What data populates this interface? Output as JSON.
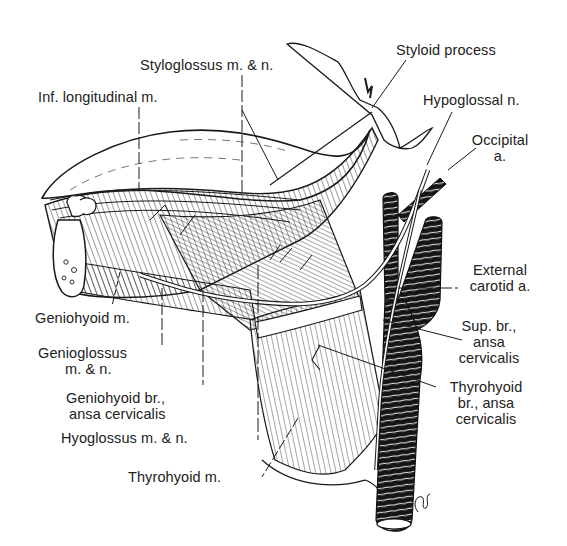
{
  "figure": {
    "colors": {
      "ink": "#1a1a1a",
      "background": "#ffffff",
      "label_text": "#222222"
    },
    "artist_signature": "jcb"
  },
  "labels": {
    "styloid_process": "Styloid process",
    "styloglossus": "Styloglossus m. & n.",
    "inf_longitudinal": "Inf. longitudinal m.",
    "hypoglossal_n": "Hypoglossal n.",
    "occipital_a_line1": "Occipital",
    "occipital_a_line2": "a.",
    "external_carotid_line1": "External",
    "external_carotid_line2": "carotid a.",
    "geniohyoid_m": "Geniohyoid m.",
    "sup_br_line1": "Sup. br.,",
    "sup_br_line2": "ansa",
    "sup_br_line3": "cervicalis",
    "genioglossus_line1": "Genioglossus",
    "genioglossus_line2": "m. & n.",
    "thyrohyoid_br_line1": "Thyrohyoid",
    "thyrohyoid_br_line2": "br., ansa",
    "thyrohyoid_br_line3": "cervicalis",
    "geniohyoid_br_line1": "Geniohyoid br.,",
    "geniohyoid_br_line2": "ansa cervicalis",
    "hyoglossus": "Hyoglossus m. & n.",
    "thyrohyoid_m": "Thyrohyoid m."
  }
}
